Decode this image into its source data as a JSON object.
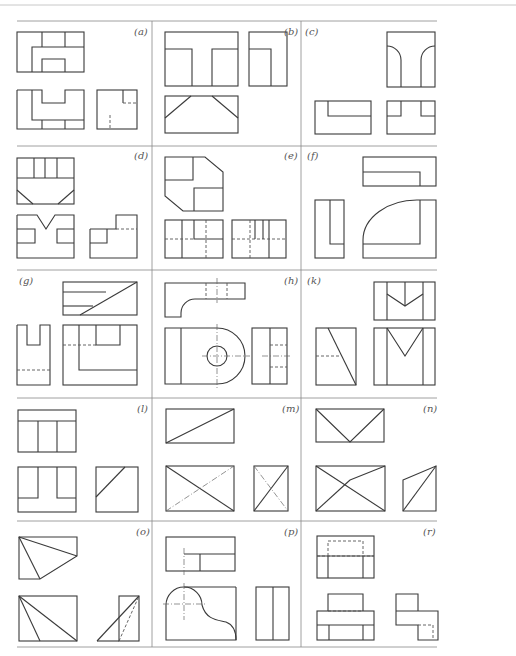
{
  "figure": {
    "grid": {
      "rows": 5,
      "columns": 3
    },
    "panels": [
      {
        "id": "a",
        "label": "(a)",
        "row": 0,
        "col": 0
      },
      {
        "id": "b",
        "label": "(b)",
        "row": 0,
        "col": 1
      },
      {
        "id": "c",
        "label": "(c)",
        "row": 0,
        "col": 2
      },
      {
        "id": "d",
        "label": "(d)",
        "row": 1,
        "col": 0
      },
      {
        "id": "e",
        "label": "(e)",
        "row": 1,
        "col": 1
      },
      {
        "id": "f",
        "label": "(f)",
        "row": 1,
        "col": 2
      },
      {
        "id": "g",
        "label": "(g)",
        "row": 2,
        "col": 0
      },
      {
        "id": "h",
        "label": "(h)",
        "row": 2,
        "col": 1
      },
      {
        "id": "k",
        "label": "(k)",
        "row": 2,
        "col": 2
      },
      {
        "id": "l",
        "label": "(l)",
        "row": 3,
        "col": 0
      },
      {
        "id": "m",
        "label": "(m)",
        "row": 3,
        "col": 1
      },
      {
        "id": "n",
        "label": "(n)",
        "row": 3,
        "col": 2
      },
      {
        "id": "o",
        "label": "(o)",
        "row": 4,
        "col": 0
      },
      {
        "id": "p",
        "label": "(p)",
        "row": 4,
        "col": 1
      },
      {
        "id": "r",
        "label": "(r)",
        "row": 4,
        "col": 2
      }
    ]
  }
}
